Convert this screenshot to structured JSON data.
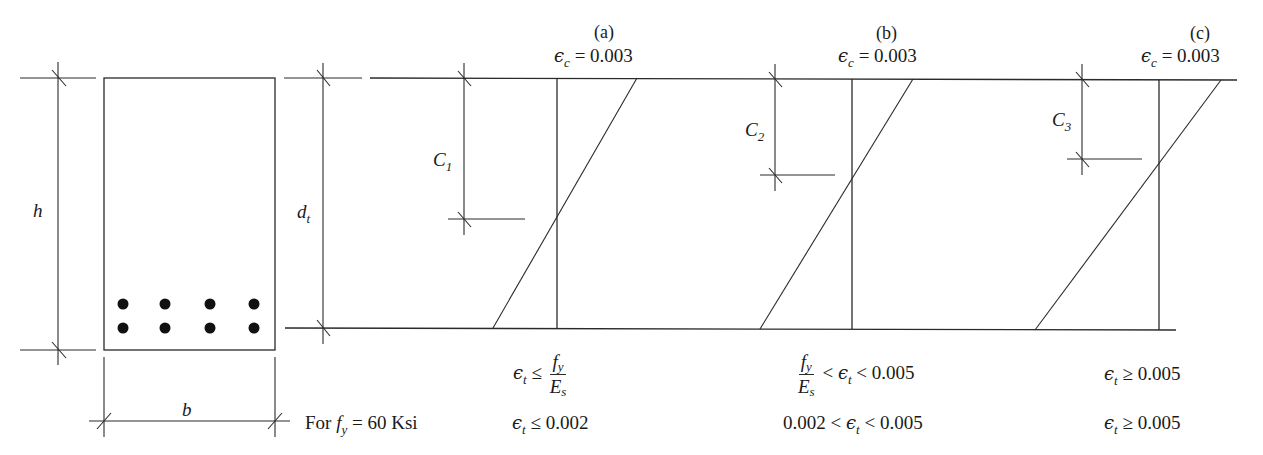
{
  "figure": {
    "section": {
      "label_h": "h",
      "label_b": "b",
      "label_dt_main": "d",
      "label_dt_sub": "t",
      "bars": {
        "rows": 2,
        "cols": 4,
        "color": "#111111"
      }
    },
    "cases": [
      {
        "id": "a",
        "caption": "(a)",
        "strain_top_sym": "ϵ",
        "strain_top_sub": "c",
        "strain_top_val": "= 0.003",
        "depth_label_main": "C",
        "depth_label_sub": "1",
        "condition_general": {
          "lhs_sym": "ϵ",
          "lhs_sub": "t",
          "op": "≤",
          "frac_num_main": "f",
          "frac_num_sub": "y",
          "frac_den_main": "E",
          "frac_den_sub": "s"
        },
        "condition_60ksi": {
          "sym": "ϵ",
          "sub": "t",
          "text": "≤ 0.002"
        }
      },
      {
        "id": "b",
        "caption": "(b)",
        "strain_top_sym": "ϵ",
        "strain_top_sub": "c",
        "strain_top_val": "= 0.003",
        "depth_label_main": "C",
        "depth_label_sub": "2",
        "condition_general": {
          "frac_num_main": "f",
          "frac_num_sub": "y",
          "frac_den_main": "E",
          "frac_den_sub": "s",
          "op1": "<",
          "sym": "ϵ",
          "sub": "t",
          "rest": "< 0.005"
        },
        "condition_60ksi": {
          "prefix": "0.002 <",
          "sym": "ϵ",
          "sub": "t",
          "rest": "< 0.005"
        }
      },
      {
        "id": "c",
        "caption": "(c)",
        "strain_top_sym": "ϵ",
        "strain_top_sub": "c",
        "strain_top_val": "= 0.003",
        "depth_label_main": "C",
        "depth_label_sub": "3",
        "condition_general": {
          "sym": "ϵ",
          "sub": "t",
          "text": "≥ 0.005"
        },
        "condition_60ksi": {
          "sym": "ϵ",
          "sub": "t",
          "text": "≥ 0.005"
        }
      }
    ],
    "row_label_60ksi": {
      "prefix": "For",
      "sym": "f",
      "sub": "y",
      "rest": "= 60 Ksi"
    }
  }
}
